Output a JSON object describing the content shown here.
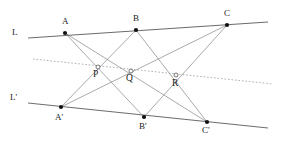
{
  "figure": {
    "width": 288,
    "height": 143,
    "background_color": "#ffffff"
  },
  "labels": {
    "line_L": "L",
    "line_L_prime": "L'",
    "A": "A",
    "B": "B",
    "C": "C",
    "A_prime": "A'",
    "B_prime": "B'",
    "C_prime": "C'",
    "P": "P",
    "Q": "Q",
    "R": "R"
  },
  "colors": {
    "main_line": "#5a5a5a",
    "cross_line": "#8e8e8e",
    "pappus_line": "#9a9a9a",
    "vertex": "#111111",
    "intersection_fill": "#ffffff",
    "text": "#1a1a1a"
  },
  "geometry": {
    "points": [
      {
        "name": "A",
        "x": 65,
        "y": 33,
        "on": "L",
        "kind": "vertex"
      },
      {
        "name": "B",
        "x": 136,
        "y": 30,
        "on": "L",
        "kind": "vertex"
      },
      {
        "name": "C",
        "x": 227,
        "y": 25,
        "on": "L",
        "kind": "vertex"
      },
      {
        "name": "A'",
        "x": 61,
        "y": 107,
        "on": "L'",
        "kind": "vertex"
      },
      {
        "name": "B'",
        "x": 144,
        "y": 117,
        "on": "L'",
        "kind": "vertex"
      },
      {
        "name": "C'",
        "x": 207,
        "y": 122,
        "on": "L'",
        "kind": "vertex"
      },
      {
        "name": "P",
        "x": 98,
        "y": 67,
        "on": "pappus",
        "kind": "intersection"
      },
      {
        "name": "Q",
        "x": 131,
        "y": 71,
        "on": "pappus",
        "kind": "intersection"
      },
      {
        "name": "R",
        "x": 176,
        "y": 75,
        "on": "pappus",
        "kind": "intersection"
      }
    ],
    "lines": [
      {
        "name": "L",
        "kind": "main",
        "x1": 28,
        "y1": 38,
        "x2": 268,
        "y2": 22
      },
      {
        "name": "L'",
        "kind": "main",
        "x1": 28,
        "y1": 103,
        "x2": 268,
        "y2": 128
      },
      {
        "name": "pappus",
        "kind": "dotted",
        "x1": 33,
        "y1": 59,
        "x2": 273,
        "y2": 84
      }
    ],
    "cross_segments": [
      {
        "name": "A-B'",
        "x1": 65,
        "y1": 33,
        "x2": 144,
        "y2": 117
      },
      {
        "name": "A-C'",
        "x1": 65,
        "y1": 33,
        "x2": 207,
        "y2": 122
      },
      {
        "name": "B-A'",
        "x1": 136,
        "y1": 30,
        "x2": 61,
        "y2": 107
      },
      {
        "name": "B-C'",
        "x1": 136,
        "y1": 30,
        "x2": 207,
        "y2": 122
      },
      {
        "name": "C-A'",
        "x1": 227,
        "y1": 25,
        "x2": 61,
        "y2": 107
      },
      {
        "name": "C-B'",
        "x1": 227,
        "y1": 25,
        "x2": 144,
        "y2": 117
      }
    ]
  },
  "label_positions": [
    {
      "key": "line_L",
      "x": 12,
      "y": 28,
      "class": "lbl-line"
    },
    {
      "key": "line_L_prime",
      "x": 10,
      "y": 93,
      "class": "lbl-line"
    },
    {
      "key": "A",
      "x": 62,
      "y": 17,
      "class": "lbl-vertex"
    },
    {
      "key": "B",
      "x": 133,
      "y": 14,
      "class": "lbl-vertex"
    },
    {
      "key": "C",
      "x": 224,
      "y": 9,
      "class": "lbl-vertex"
    },
    {
      "key": "A_prime",
      "x": 55,
      "y": 113,
      "class": "lbl-vertex"
    },
    {
      "key": "B_prime",
      "x": 139,
      "y": 122,
      "class": "lbl-vertex"
    },
    {
      "key": "C_prime",
      "x": 202,
      "y": 126,
      "class": "lbl-vertex"
    },
    {
      "key": "P",
      "x": 93,
      "y": 70,
      "class": "lbl-inter"
    },
    {
      "key": "Q",
      "x": 126,
      "y": 74,
      "class": "lbl-inter"
    },
    {
      "key": "R",
      "x": 172,
      "y": 79,
      "class": "lbl-inter"
    }
  ]
}
